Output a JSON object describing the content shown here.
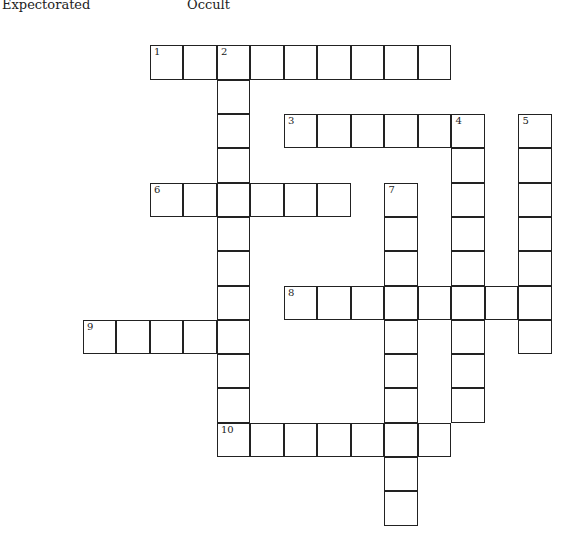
{
  "hints": [
    {
      "text": "Expectorated",
      "x": 2
    },
    {
      "text": "Occult",
      "x": 187
    }
  ],
  "grid": {
    "origin_x": 83.5,
    "origin_y": 46,
    "cell_w": 33.5,
    "cell_h": 34.3,
    "entries": [
      {
        "number": 1,
        "direction": "across",
        "row": 0,
        "col": 2,
        "length": 9
      },
      {
        "number": 2,
        "direction": "down",
        "row": 0,
        "col": 4,
        "length": 12
      },
      {
        "number": 3,
        "direction": "across",
        "row": 2,
        "col": 6,
        "length": 6
      },
      {
        "number": 4,
        "direction": "down",
        "row": 2,
        "col": 11,
        "length": 9
      },
      {
        "number": 5,
        "direction": "down",
        "row": 2,
        "col": 13,
        "length": 7
      },
      {
        "number": 6,
        "direction": "across",
        "row": 4,
        "col": 2,
        "length": 6
      },
      {
        "number": 7,
        "direction": "down",
        "row": 4,
        "col": 9,
        "length": 10
      },
      {
        "number": 8,
        "direction": "across",
        "row": 7,
        "col": 6,
        "length": 8
      },
      {
        "number": 9,
        "direction": "across",
        "row": 8,
        "col": 0,
        "length": 5
      },
      {
        "number": 10,
        "direction": "across",
        "row": 11,
        "col": 4,
        "length": 7
      }
    ]
  }
}
